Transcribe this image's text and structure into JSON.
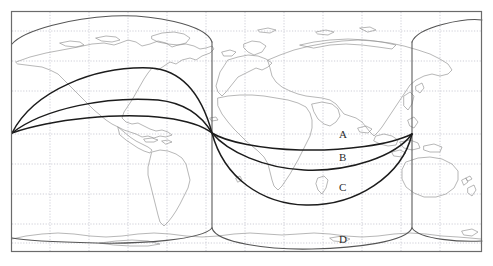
{
  "figure": {
    "type": "world-map-great-circle-routes",
    "title": "",
    "background_color": "#ffffff",
    "frame": {
      "color": "#6b6b6b",
      "x": 11,
      "y": 11,
      "width": 471,
      "height": 241
    },
    "graticule": {
      "color": "#b9b9c6",
      "style": "dotted",
      "vertical_lines_x": [
        50,
        89,
        128,
        167,
        206,
        245,
        284,
        323,
        362,
        401,
        440
      ],
      "horizontal_lines_y": [
        31,
        61,
        91,
        104,
        134,
        164,
        194,
        224,
        243
      ]
    },
    "coastline_color": "#8a8a8a",
    "route_color": "#1c1c1c",
    "cylinder_color": "#555555",
    "endpoints": {
      "left_terminal": {
        "x": 12,
        "y": 133
      },
      "right_terminal": {
        "x": 412,
        "y": 134
      },
      "mid_crossing": {
        "x": 212,
        "y": 133
      }
    },
    "cylinder": {
      "left_edge_x": 212,
      "right_edge_x": 412,
      "top_ellipse_center_y": 42,
      "bottom_ellipse_center_y": 228
    }
  },
  "labels": [
    {
      "id": "A",
      "text": "A",
      "x": 339,
      "y": 129
    },
    {
      "id": "B",
      "text": "B",
      "x": 339,
      "y": 152
    },
    {
      "id": "C",
      "text": "C",
      "x": 339,
      "y": 182
    },
    {
      "id": "D",
      "text": "D",
      "x": 339,
      "y": 234
    }
  ],
  "routes": [
    {
      "id": "A",
      "name": "route-a",
      "description": "shallow arc, northern hemisphere bulge west / eastern leg hugging equator",
      "west_leg_peak_y": 120,
      "east_leg_peak_y": 147
    },
    {
      "id": "B",
      "name": "route-b",
      "description": "medium arc",
      "west_leg_peak_y": 107,
      "east_leg_peak_y": 166
    },
    {
      "id": "C",
      "name": "route-c",
      "description": "deep great-circle arc",
      "west_leg_peak_y": 71,
      "east_leg_peak_y": 198
    },
    {
      "id": "D",
      "name": "route-d",
      "description": "cylinder projection outline, extreme arc along cylinder rims",
      "west_leg_peak_y": 21,
      "east_leg_peak_y": 246
    }
  ]
}
